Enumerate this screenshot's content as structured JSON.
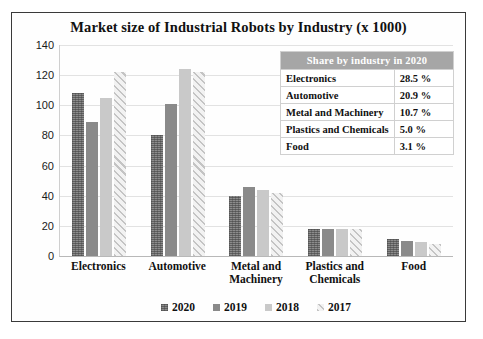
{
  "chart_data": {
    "type": "bar",
    "title": "Market size of Industrial Robots by Industry (x 1000)",
    "xlabel": "",
    "ylabel": "",
    "ylim": [
      0,
      140
    ],
    "yticks": [
      0,
      20,
      40,
      60,
      80,
      100,
      120,
      140
    ],
    "grid": true,
    "legend_position": "bottom",
    "categories": [
      "Electronics",
      "Automotive",
      "Metal and Machinery",
      "Plastics and Chemicals",
      "Food"
    ],
    "series": [
      {
        "name": "2020",
        "values": [
          108,
          80,
          40,
          18,
          11
        ]
      },
      {
        "name": "2019",
        "values": [
          89,
          101,
          46,
          18,
          10
        ]
      },
      {
        "name": "2018",
        "values": [
          105,
          124,
          44,
          18,
          9
        ]
      },
      {
        "name": "2017",
        "values": [
          122,
          122,
          42,
          18,
          8
        ]
      }
    ]
  },
  "share_table": {
    "header": "Share by industry in 2020",
    "rows": [
      {
        "industry": "Electronics",
        "share": "28.5 %"
      },
      {
        "industry": "Automotive",
        "share": "20.9 %"
      },
      {
        "industry": "Metal and Machinery",
        "share": "10.7 %"
      },
      {
        "industry": "Plastics and Chemicals",
        "share": "5.0 %"
      },
      {
        "industry": "Food",
        "share": "3.1 %"
      }
    ]
  }
}
